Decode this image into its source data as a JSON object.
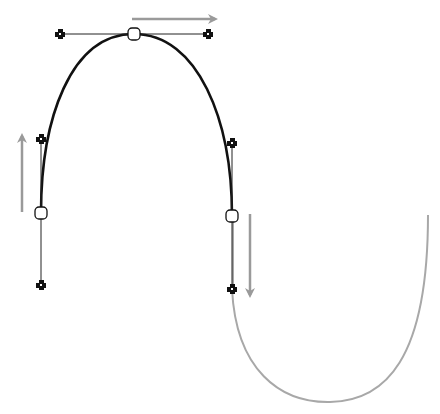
{
  "diagram": {
    "type": "bezier-path-editing",
    "colors": {
      "path_selected": "#111111",
      "path_unselected": "#a8a8a8",
      "handle_line": "#222222",
      "arrow": "#9a9a9a",
      "background": "#ffffff"
    },
    "anchors": [
      {
        "name": "left-anchor",
        "x": 41,
        "y": 213,
        "handle_in": {
          "x": 41,
          "y": 285
        },
        "handle_out": {
          "x": 41,
          "y": 139
        }
      },
      {
        "name": "top-anchor",
        "x": 134,
        "y": 34,
        "handle_in": {
          "x": 60,
          "y": 34
        },
        "handle_out": {
          "x": 208,
          "y": 34
        }
      },
      {
        "name": "right-anchor",
        "x": 232,
        "y": 216,
        "handle_in": {
          "x": 232,
          "y": 143
        },
        "handle_out": {
          "x": 232,
          "y": 289
        }
      }
    ],
    "arrows": [
      {
        "name": "arrow-up",
        "direction": "up",
        "x1": 22,
        "y1": 212,
        "x2": 22,
        "y2": 133
      },
      {
        "name": "arrow-right",
        "direction": "right",
        "x1": 132,
        "y1": 19,
        "x2": 218,
        "y2": 19
      },
      {
        "name": "arrow-down",
        "direction": "down",
        "x1": 250,
        "y1": 214,
        "x2": 250,
        "y2": 298
      }
    ],
    "unselected_segment": {
      "start": {
        "x": 232,
        "y": 289
      },
      "bottom": {
        "x": 330,
        "y": 402
      },
      "end": {
        "x": 428,
        "y": 215
      }
    }
  }
}
